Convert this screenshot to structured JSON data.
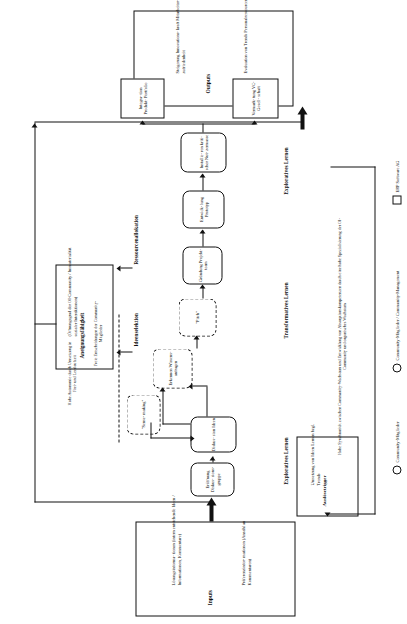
{
  "figure": {
    "orientation": "landscape-rotated-90-ccw",
    "language": "de"
  },
  "inputs_box": {
    "title": "Inputs",
    "items": [
      "Lösungsinforma-\ntionen (intern\nentstehende Ideen /\nInformationen,\nKommentare)",
      "Präferenzinfor-\nmationen (Anzahl\nan Kommentaren)"
    ],
    "item1": "Lösungsinforma- tionen (intern entstehende Ideen / Informationen, Kommentare)",
    "item2": "Präferenzinfor- mationen (Anzahl an Kommentaren)"
  },
  "outputs_box": {
    "title": "Outputs",
    "item1": "Steigerung Innovations- kraft Mitarbeiter- zufriedenheit",
    "item2": "Evaluation von Trends Personalressourcen"
  },
  "trigger_box": {
    "title": "Auslösetrigger",
    "text": "Umsetzung von Ideen Lernen bzgl. Trends"
  },
  "appropriability_box": {
    "title": "Aneignungsfähigkeit",
    "text": "(Öffnungsgrad der OI-Community / Immaterialität sozialer Interaktionen)"
  },
  "process": {
    "step_open": "Eröffnung Diskus- sions- gruppe",
    "step_discuss": "Diskus- sion Ideen",
    "step_sense": "\"Sense- making\"",
    "step_recognize": "Erkennen Wissens- anfragen",
    "step_pitch": "\"Pitch\"",
    "step_found": "Gründung Projekt- team",
    "step_prototype": "Entwick- lung Prototyp",
    "step_criticalmass": "Installie- ren kriti- scher Nut- zermasse",
    "out_integration": "Integra- tion Produkt- Portfolio",
    "out_marketing": "Vermark- tung VC- Gesell- schaft"
  },
  "annotations": {
    "autonomy": "Hohe Autonomie durch Umsetzung in Frei- und Leerlaufzeit",
    "free_decisions": "Freie Entscheidungen der Community-Mitglieder",
    "idea_selection": "Ideenselektion",
    "resource_allocation": "Ressourcenallokation",
    "bottom_note": "Hohe Synchronität zwischen Community-Wachstum und Entwicklung von Absorptionskompetenzen durch eine hohe Spezialisierung der OI-Community und organisches Wachstum"
  },
  "phase_labels": {
    "explorative_left": "Exploratives Lernen",
    "transformative": "Transformatives Lernen",
    "explorative_right": "Exploratives Lernen"
  },
  "legend": {
    "item1_label": "Community-Mitglieder",
    "item1_symbol": "circle-icon",
    "item2_label": "Community-Mitglieder / Community-Management",
    "item2_symbol": "circle-icon",
    "item3_label": "ERP Software AG",
    "item3_symbol": "square-icon"
  },
  "colors": {
    "stroke": "#111111",
    "background": "#ffffff"
  }
}
